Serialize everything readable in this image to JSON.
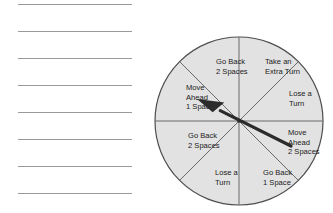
{
  "page": {
    "background_color": "#ffffff"
  },
  "writing_lines": {
    "count": 8,
    "color": "#9a9a9a",
    "y_positions": [
      4,
      31,
      58,
      85,
      112,
      139,
      166,
      193
    ],
    "left": 18,
    "width": 114,
    "values": [
      "",
      "",
      "",
      "",
      "",
      "",
      "",
      ""
    ]
  },
  "spinner": {
    "name": "game-spinner",
    "center_x": 89,
    "center_y": 93,
    "radius": 84,
    "fill_color": "#e2e2e2",
    "stroke_color": "#4d4d4d",
    "divider_color": "#6b6b6b",
    "arrow_color": "#2b2b2b",
    "arrow": {
      "tail_x": 141,
      "tail_y": 118,
      "tip_x": 47,
      "tip_y": 71,
      "points_to": "Move Ahead 1 Space"
    },
    "segment_count": 8,
    "segments": [
      {
        "index": 0,
        "name": "segment-take-an-extra-turn",
        "label": "Take an Extra Turn",
        "lines": [
          "Take an",
          "Extra Turn"
        ],
        "start_angle_deg": -90,
        "end_angle_deg": -45,
        "label_x": 115,
        "label_y": 36
      },
      {
        "index": 1,
        "name": "segment-lose-a-turn-right",
        "label": "Lose a Turn",
        "lines": [
          "Lose a",
          "Turn"
        ],
        "start_angle_deg": -45,
        "end_angle_deg": 0,
        "label_x": 139,
        "label_y": 68
      },
      {
        "index": 2,
        "name": "segment-move-ahead-2-spaces",
        "label": "Move Ahead 2 Spaces",
        "lines": [
          "Move",
          "Ahead",
          "2 Spaces"
        ],
        "start_angle_deg": 0,
        "end_angle_deg": 45,
        "label_x": 138,
        "label_y": 107
      },
      {
        "index": 3,
        "name": "segment-go-back-1-space",
        "label": "Go Back 1 Space",
        "lines": [
          "Go Back",
          "1 Space"
        ],
        "start_angle_deg": 45,
        "end_angle_deg": 90,
        "label_x": 113,
        "label_y": 147
      },
      {
        "index": 4,
        "name": "segment-lose-a-turn-bottom",
        "label": "Lose a Turn",
        "lines": [
          "Lose a",
          "Turn"
        ],
        "start_angle_deg": 90,
        "end_angle_deg": 135,
        "label_x": 65,
        "label_y": 147
      },
      {
        "index": 5,
        "name": "segment-go-back-2-spaces-left",
        "label": "Go Back 2 Spaces",
        "lines": [
          "Go Back",
          "2 Spaces"
        ],
        "start_angle_deg": 135,
        "end_angle_deg": 180,
        "label_x": 38,
        "label_y": 110
      },
      {
        "index": 6,
        "name": "segment-move-ahead-1-space",
        "label": "Move Ahead 1 Space",
        "lines": [
          "Move",
          "Ahead",
          "1 Space"
        ],
        "start_angle_deg": 180,
        "end_angle_deg": 225,
        "label_x": 36,
        "label_y": 62
      },
      {
        "index": 7,
        "name": "segment-go-back-2-spaces-top",
        "label": "Go Back 2 Spaces",
        "lines": [
          "Go Back",
          "2 Spaces"
        ],
        "start_angle_deg": 225,
        "end_angle_deg": 270,
        "label_x": 66,
        "label_y": 36
      }
    ]
  }
}
